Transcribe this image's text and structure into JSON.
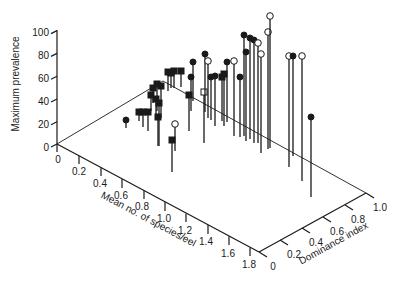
{
  "chart_data": {
    "type": "scatter",
    "subtype": "3d-stem",
    "title": "",
    "zlabel": "Maximum prevalence",
    "xlabel": "Mean no. of species/eel",
    "ylabel": "Dominance index",
    "z_ticks": [
      "0",
      "20",
      "40",
      "60",
      "80",
      "100"
    ],
    "x_ticks": [
      "0",
      "0.2",
      "0.4",
      "0.6",
      "0.8",
      "1.0",
      "1.2",
      "1.4",
      "1.6",
      "1.8"
    ],
    "y_ticks": [
      "0",
      "0.2",
      "0.4",
      "0.6",
      "0.8",
      "1.0"
    ],
    "zlim": [
      0,
      100
    ],
    "xlim": [
      0,
      1.9
    ],
    "ylim": [
      0,
      1.0
    ],
    "grid": false,
    "legend": null,
    "marker_types": {
      "filled_circle": "#1a1a1a",
      "open_circle": "#ffffff",
      "filled_square": "#1a1a1a",
      "open_square": "#ffffff"
    },
    "points_screen": [
      {
        "m": "fc",
        "x": 126,
        "top": 120,
        "base": 128
      },
      {
        "m": "fs",
        "x": 139,
        "top": 112,
        "base": 121
      },
      {
        "m": "fs",
        "x": 143,
        "top": 112,
        "base": 127
      },
      {
        "m": "fs",
        "x": 148,
        "top": 112,
        "base": 131
      },
      {
        "m": "fs",
        "x": 151,
        "top": 95,
        "base": 111
      },
      {
        "m": "fs",
        "x": 153,
        "top": 88,
        "base": 103
      },
      {
        "m": "fs",
        "x": 156,
        "top": 99,
        "base": 120
      },
      {
        "m": "fs",
        "x": 157,
        "top": 84,
        "base": 111
      },
      {
        "m": "fs",
        "x": 158,
        "top": 117,
        "base": 146
      },
      {
        "m": "fs",
        "x": 159,
        "top": 103,
        "base": 146
      },
      {
        "m": "fs",
        "x": 161,
        "top": 86,
        "base": 118
      },
      {
        "m": "fs",
        "x": 168,
        "top": 72,
        "base": 91
      },
      {
        "m": "fs",
        "x": 171,
        "top": 73,
        "base": 88
      },
      {
        "m": "fs",
        "x": 174,
        "top": 71,
        "base": 88
      },
      {
        "m": "fs",
        "x": 172,
        "top": 140,
        "base": 172
      },
      {
        "m": "oc",
        "x": 175,
        "top": 124,
        "base": 151
      },
      {
        "m": "fs",
        "x": 181,
        "top": 71,
        "base": 87
      },
      {
        "m": "fc",
        "x": 191,
        "top": 77,
        "base": 111
      },
      {
        "m": "fs",
        "x": 189,
        "top": 95,
        "base": 131
      },
      {
        "m": "fc",
        "x": 193,
        "top": 62,
        "base": 101
      },
      {
        "m": "os",
        "x": 204,
        "top": 92,
        "base": 143
      },
      {
        "m": "fc",
        "x": 205,
        "top": 54,
        "base": 112
      },
      {
        "m": "oc",
        "x": 208,
        "top": 61,
        "base": 118
      },
      {
        "m": "fc",
        "x": 211,
        "top": 77,
        "base": 120
      },
      {
        "m": "fc",
        "x": 215,
        "top": 76,
        "base": 126
      },
      {
        "m": "fs",
        "x": 222,
        "top": 77,
        "base": 121
      },
      {
        "m": "fs",
        "x": 224,
        "top": 74,
        "base": 126
      },
      {
        "m": "fc",
        "x": 227,
        "top": 62,
        "base": 122
      },
      {
        "m": "oc",
        "x": 234,
        "top": 61,
        "base": 136
      },
      {
        "m": "fc",
        "x": 240,
        "top": 77,
        "base": 137
      },
      {
        "m": "fc",
        "x": 244,
        "top": 35,
        "base": 136
      },
      {
        "m": "fc",
        "x": 246,
        "top": 52,
        "base": 141
      },
      {
        "m": "fc",
        "x": 250,
        "top": 38,
        "base": 139
      },
      {
        "m": "fc",
        "x": 254,
        "top": 40,
        "base": 143
      },
      {
        "m": "oc",
        "x": 258,
        "top": 43,
        "base": 143
      },
      {
        "m": "oc",
        "x": 261,
        "top": 54,
        "base": 153
      },
      {
        "m": "oc",
        "x": 268,
        "top": 32,
        "base": 149
      },
      {
        "m": "oc",
        "x": 270,
        "top": 16,
        "base": 148
      },
      {
        "m": "oc",
        "x": 289,
        "top": 56,
        "base": 167
      },
      {
        "m": "fc",
        "x": 293,
        "top": 56,
        "base": 156
      },
      {
        "m": "oc",
        "x": 302,
        "top": 56,
        "base": 181
      },
      {
        "m": "fc",
        "x": 311,
        "top": 117,
        "base": 197
      }
    ],
    "points_estimated": [
      {
        "marker": "filled_circle",
        "species": 0.55,
        "dominance": 0.45,
        "prevalence": 7
      },
      {
        "marker": "filled_square",
        "species": 0.85,
        "dominance": 0.55,
        "prevalence": 10
      },
      {
        "marker": "filled_square",
        "species": 0.95,
        "dominance": 0.5,
        "prevalence": 14
      },
      {
        "marker": "filled_square",
        "species": 1.0,
        "dominance": 0.5,
        "prevalence": 17
      },
      {
        "marker": "filled_square",
        "species": 0.8,
        "dominance": 0.7,
        "prevalence": 18
      },
      {
        "marker": "filled_square",
        "species": 1.0,
        "dominance": 0.6,
        "prevalence": 26
      },
      {
        "marker": "filled_square",
        "species": 1.1,
        "dominance": 0.6,
        "prevalence": 28
      },
      {
        "marker": "filled_square",
        "species": 1.25,
        "dominance": 0.55,
        "prevalence": 26
      },
      {
        "marker": "filled_square",
        "species": 1.35,
        "dominance": 0.5,
        "prevalence": 28
      },
      {
        "marker": "filled_square",
        "species": 1.2,
        "dominance": 0.7,
        "prevalence": 28
      },
      {
        "marker": "filled_square",
        "species": 1.2,
        "dominance": 0.75,
        "prevalence": 28
      },
      {
        "marker": "filled_square",
        "species": 1.6,
        "dominance": 0.5,
        "prevalence": 28
      },
      {
        "marker": "open_circle",
        "species": 1.45,
        "dominance": 0.5,
        "prevalence": 24
      },
      {
        "marker": "filled_circle",
        "species": 1.1,
        "dominance": 0.9,
        "prevalence": 30
      },
      {
        "marker": "filled_circle",
        "species": 1.2,
        "dominance": 0.9,
        "prevalence": 34
      },
      {
        "marker": "open_square",
        "species": 1.4,
        "dominance": 0.85,
        "prevalence": 45
      },
      {
        "marker": "filled_circle",
        "species": 1.2,
        "dominance": 0.95,
        "prevalence": 51
      },
      {
        "marker": "open_circle",
        "species": 1.3,
        "dominance": 0.9,
        "prevalence": 50
      },
      {
        "marker": "filled_circle",
        "species": 1.25,
        "dominance": 0.95,
        "prevalence": 38
      },
      {
        "marker": "filled_circle",
        "species": 1.5,
        "dominance": 0.85,
        "prevalence": 52
      },
      {
        "marker": "filled_circle",
        "species": 1.6,
        "dominance": 0.85,
        "prevalence": 66
      },
      {
        "marker": "filled_circle",
        "species": 1.7,
        "dominance": 0.85,
        "prevalence": 80
      },
      {
        "marker": "filled_circle",
        "species": 1.7,
        "dominance": 0.9,
        "prevalence": 90
      },
      {
        "marker": "filled_circle",
        "species": 1.75,
        "dominance": 0.9,
        "prevalence": 87
      },
      {
        "marker": "open_circle",
        "species": 1.8,
        "dominance": 0.9,
        "prevalence": 88
      },
      {
        "marker": "open_circle",
        "species": 1.85,
        "dominance": 0.95,
        "prevalence": 87
      },
      {
        "marker": "open_circle",
        "species": 1.85,
        "dominance": 1.0,
        "prevalence": 100
      },
      {
        "marker": "open_circle",
        "species": 1.9,
        "dominance": 0.95,
        "prevalence": 97
      },
      {
        "marker": "open_circle",
        "species": 1.9,
        "dominance": 1.0,
        "prevalence": 97
      },
      {
        "marker": "filled_circle",
        "species": 1.85,
        "dominance": 0.5,
        "prevalence": 70
      }
    ]
  }
}
